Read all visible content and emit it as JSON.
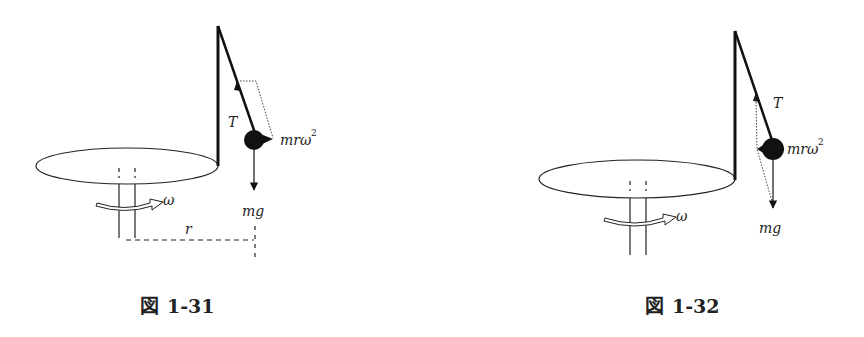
{
  "figures": [
    {
      "caption_symbol": "図",
      "caption_number": "1-31",
      "labels": {
        "tension": "T",
        "centrifugal": "mrω",
        "centrifugal_sup": "2",
        "gravity": "mg",
        "angular_velocity": "ω",
        "radius": "r"
      }
    },
    {
      "caption_symbol": "図",
      "caption_number": "1-32",
      "labels": {
        "tension": "T",
        "centrifugal": "mrω",
        "centrifugal_sup": "2",
        "gravity": "mg",
        "angular_velocity": "ω"
      }
    }
  ]
}
